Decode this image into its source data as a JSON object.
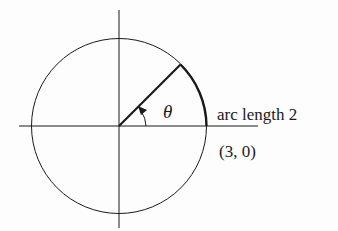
{
  "diagram": {
    "theta_label": "θ",
    "arc_label": "arc length 2",
    "point_label": "(3, 0)",
    "center": [
      119,
      126
    ],
    "radius": 87,
    "radial_end": [
      180,
      65
    ],
    "stroke_color": "#1a1a1a"
  }
}
